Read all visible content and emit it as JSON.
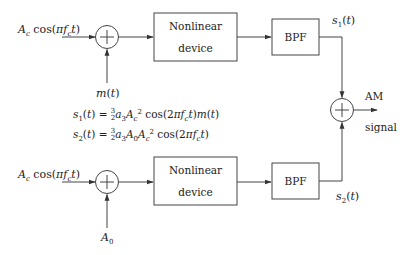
{
  "diagram": {
    "top_branch": {
      "carrier_input": "A_c cos(π f_c t)",
      "summer_input": "m(t)",
      "nonlinear_box": [
        "Nonlinear",
        "device"
      ],
      "filter_box": "BPF",
      "output_label": "s_1(t)"
    },
    "bottom_branch": {
      "carrier_input": "A_c cos(π f_c t)",
      "summer_input": "A_0",
      "nonlinear_box": [
        "Nonlinear",
        "device"
      ],
      "filter_box": "BPF",
      "output_label": "s_2(t)"
    },
    "output": {
      "label_line1": "AM",
      "label_line2": "signal"
    },
    "equations": [
      "s_1(t) = (3/2) a_3 A_c^2 cos(2π f_c t) m(t)",
      "s_2(t) = (3/2) a_3 A_0 A_c^2 cos(2π f_c t)"
    ],
    "colors": {
      "stroke": "#444444",
      "text": "#222222"
    }
  },
  "labels": {
    "top_nl_1": "Nonlinear",
    "top_nl_2": "device",
    "bot_nl_1": "Nonlinear",
    "bot_nl_2": "device",
    "bpf": "BPF",
    "am": "AM",
    "signal": "signal"
  }
}
